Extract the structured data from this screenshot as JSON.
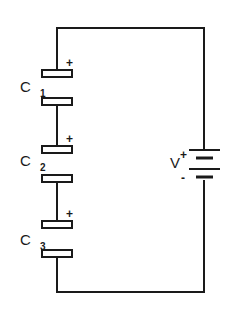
{
  "diagram": {
    "type": "circuit",
    "capacitors": [
      {
        "name": "C",
        "subscript": "1",
        "polarity": "+"
      },
      {
        "name": "C",
        "subscript": "2",
        "polarity": "+"
      },
      {
        "name": "C",
        "subscript": "3",
        "polarity": "+"
      }
    ],
    "battery": {
      "label": "V",
      "positive": "+",
      "negative": "-"
    },
    "colors": {
      "line": "#1a1a1a",
      "background": "#ffffff"
    }
  }
}
